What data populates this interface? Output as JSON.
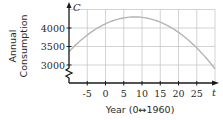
{
  "chart_data": {
    "type": "line",
    "title": "",
    "xlabel": "Year (0↔1960)",
    "ylabel_line1": "Annual",
    "ylabel_line2": "Consumption",
    "x_var": "t",
    "y_var": "C",
    "x_ticks": [
      "-5",
      "0",
      "5",
      "10",
      "15",
      "20",
      "25"
    ],
    "x_tick_values": [
      -5,
      0,
      5,
      10,
      15,
      20,
      25
    ],
    "y_ticks": [
      "3000",
      "3500",
      "4000"
    ],
    "y_tick_values": [
      3000,
      3500,
      4000
    ],
    "xlim": [
      -10,
      30
    ],
    "ylim": [
      3000,
      4500
    ],
    "y_axis_break": true,
    "grid": true,
    "series": [
      {
        "name": "C(t)",
        "x": [
          -10,
          -5,
          0,
          5,
          8,
          10,
          15,
          20,
          25,
          30
        ],
        "values": [
          3330,
          3790,
          4110,
          4270,
          4300,
          4290,
          4150,
          3870,
          3430,
          2850
        ]
      }
    ],
    "colors": {
      "curve": "#b4b4b4",
      "grid": "#c8c8c8",
      "axis": "#1a1a1a"
    }
  }
}
